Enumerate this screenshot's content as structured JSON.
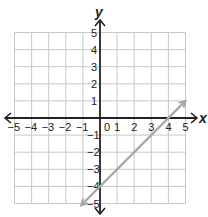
{
  "chart_data": {
    "type": "line",
    "title": "",
    "xlabel": "x",
    "ylabel": "y",
    "xlim": [
      -5,
      5
    ],
    "ylim": [
      -5,
      5
    ],
    "grid": true,
    "x_ticks": [
      "-5",
      "-4",
      "-3",
      "-2",
      "-1",
      "0",
      "1",
      "2",
      "3",
      "4",
      "5"
    ],
    "y_ticks": [
      "5",
      "4",
      "3",
      "2",
      "1",
      "-1",
      "-2",
      "-3",
      "-4",
      "-5"
    ],
    "series": [
      {
        "name": "line",
        "equation": "y = x - 4",
        "color": "#a6a6a6",
        "x": [
          -1.1,
          5
        ],
        "y": [
          -5.1,
          1
        ],
        "arrows": "both",
        "intercepts": {
          "x_intercept": 4,
          "y_intercept": -4
        }
      }
    ]
  },
  "labels": {
    "x_axis": "x",
    "y_axis": "y",
    "origin": "0"
  },
  "colors": {
    "grid": "#c8c8c8",
    "axis": "#222222",
    "line": "#a6a6a6"
  }
}
